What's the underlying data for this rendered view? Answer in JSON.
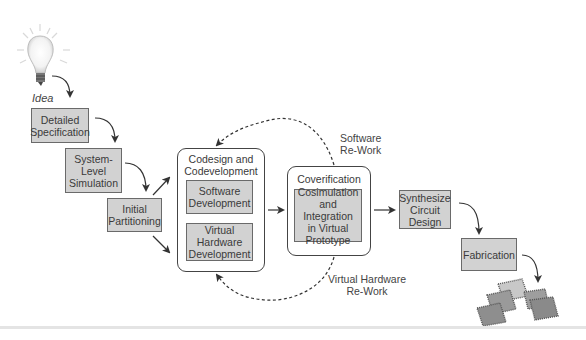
{
  "diagram": {
    "start": {
      "label": "Idea",
      "icon": "lightbulb-icon"
    },
    "steps": [
      {
        "id": "spec",
        "label": "Detailed\nSpecification"
      },
      {
        "id": "sim",
        "label": "System-\nLevel\nSimulation"
      },
      {
        "id": "part",
        "label": "Initial\nPartitioning"
      },
      {
        "id": "synth",
        "label": "Synthesize\nCircuit\nDesign"
      },
      {
        "id": "fab",
        "label": "Fabrication"
      }
    ],
    "codesign_group": {
      "title": "Codesign and\nCodevelopment",
      "items": [
        {
          "id": "sw",
          "label": "Software\nDevelopment"
        },
        {
          "id": "hw",
          "label": "Virtual\nHardware\nDevelopment"
        }
      ]
    },
    "coverification_group": {
      "title": "Coverification",
      "items": [
        {
          "id": "cosim",
          "label": "Cosimulation\nand Integration\nin Virtual\nPrototype"
        }
      ]
    },
    "feedback_loops": [
      {
        "label": "Software\nRe-Work",
        "from": "cosim",
        "to": "codesign",
        "style": "dashed"
      },
      {
        "label": "Virtual Hardware\nRe-Work",
        "from": "cosim",
        "to": "codesign",
        "style": "dashed"
      }
    ],
    "end": {
      "icon": "chips-icon"
    },
    "colors": {
      "box_fill": "#d2d2d2",
      "box_border": "#6a6a6a",
      "arrow": "#333333"
    }
  }
}
